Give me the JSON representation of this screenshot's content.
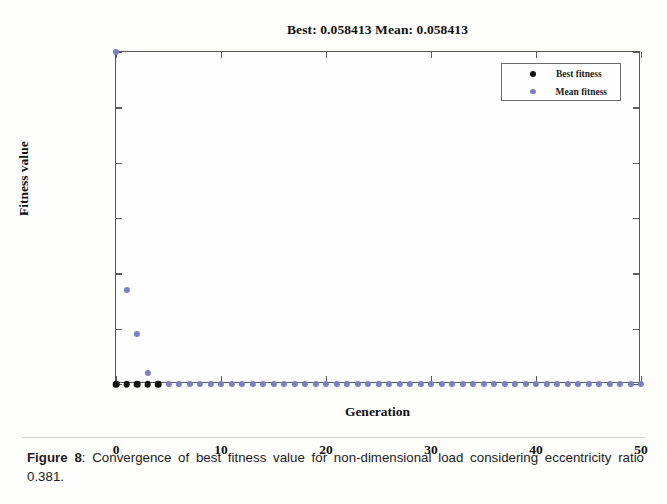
{
  "chart_data": {
    "type": "scatter",
    "title": "Best: 0.058413 Mean: 0.058413",
    "xlabel": "Generation",
    "ylabel": "Fitness value",
    "xlim": [
      0,
      50
    ],
    "xticks": [
      "0",
      "10",
      "20",
      "30",
      "40",
      "50"
    ],
    "xtick_values": [
      0,
      10,
      20,
      30,
      40,
      50
    ],
    "yticks": [
      "0.0584",
      "0.0584",
      "0.0584",
      "0.0584",
      "0.0584",
      "0.0584",
      "0.0584"
    ],
    "ytick_values": [
      0.058413,
      0.0584131,
      0.0584132,
      0.0584133,
      0.0584134,
      0.0584135,
      0.0584136
    ],
    "grid": false,
    "legend_position": "top-right",
    "series": [
      {
        "name": "Best fitness",
        "color": "#141414",
        "marker": "circle",
        "x": [
          0,
          1,
          2,
          3,
          4
        ],
        "y": [
          0.058413,
          0.058413,
          0.058413,
          0.058413,
          0.058413
        ]
      },
      {
        "name": "Mean fitness",
        "color": "#7b7fc4",
        "marker": "circle",
        "x": [
          0,
          1,
          2,
          3,
          4,
          5,
          6,
          7,
          8,
          9,
          10,
          11,
          12,
          13,
          14,
          15,
          16,
          17,
          18,
          19,
          20,
          21,
          22,
          23,
          24,
          25,
          26,
          27,
          28,
          29,
          30,
          31,
          32,
          33,
          34,
          35,
          36,
          37,
          38,
          39,
          40,
          41,
          42,
          43,
          44,
          45,
          46,
          47,
          48,
          49,
          50
        ],
        "y": [
          0.0584136,
          0.05841317,
          0.05841309,
          0.05841302,
          0.058413,
          0.058413,
          0.058413,
          0.058413,
          0.058413,
          0.058413,
          0.058413,
          0.058413,
          0.058413,
          0.058413,
          0.058413,
          0.058413,
          0.058413,
          0.058413,
          0.058413,
          0.058413,
          0.058413,
          0.058413,
          0.058413,
          0.058413,
          0.058413,
          0.058413,
          0.058413,
          0.058413,
          0.058413,
          0.058413,
          0.058413,
          0.058413,
          0.058413,
          0.058413,
          0.058413,
          0.058413,
          0.058413,
          0.058413,
          0.058413,
          0.058413,
          0.058413,
          0.058413,
          0.058413,
          0.058413,
          0.058413,
          0.058413,
          0.058413,
          0.058413,
          0.058413,
          0.058413,
          0.058413
        ]
      }
    ]
  },
  "legend": {
    "entries": [
      {
        "label": "Best fitness",
        "color": "#141414"
      },
      {
        "label": "Mean fitness",
        "color": "#7b7fc4"
      }
    ]
  },
  "caption": {
    "label": "Figure 8",
    "separator": ": ",
    "text": "Convergence of best fitness value for non-dimensional load considering eccentricity ratio 0.381."
  }
}
